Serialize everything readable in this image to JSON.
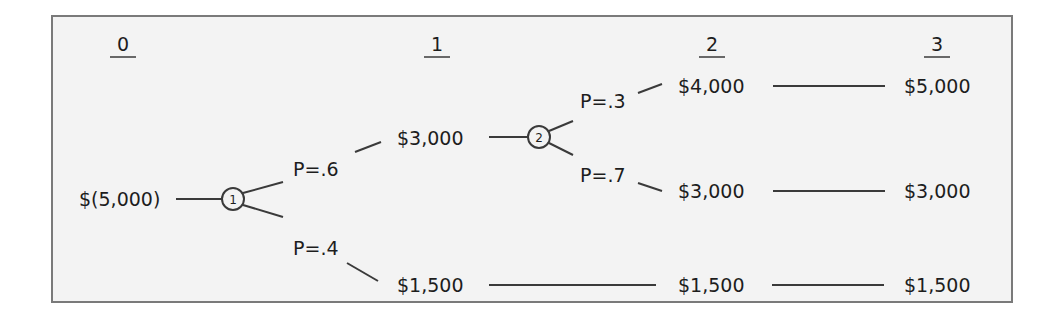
{
  "periods": [
    "0",
    "1",
    "2",
    "3"
  ],
  "nodes": [
    {
      "id": "1"
    },
    {
      "id": "2"
    }
  ],
  "period0": {
    "initial_outlay": "$(5,000)"
  },
  "period1": {
    "branch_up": {
      "probability": "P=.6",
      "cash_flow": "$3,000"
    },
    "branch_down": {
      "probability": "P=.4",
      "cash_flow": "$1,500"
    }
  },
  "period2": {
    "branch_up": {
      "probability": "P=.3",
      "cash_flow": "$4,000"
    },
    "branch_down": {
      "probability": "P=.7",
      "cash_flow": "$3,000"
    },
    "low_path_cash_flow": "$1,500"
  },
  "period3": {
    "top": "$5,000",
    "middle": "$3,000",
    "bottom": "$1,500"
  },
  "colors": {
    "background": "#f3f3f3",
    "frame": "#7a7a7a",
    "line": "#3a3a3a",
    "text": "#1d1d1d"
  }
}
